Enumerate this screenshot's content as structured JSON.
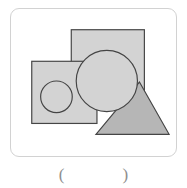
{
  "figure": {
    "frame": {
      "x": 10,
      "y": 8,
      "width": 167,
      "height": 149,
      "corner_radius": 9,
      "border_color": "#d2d2d2",
      "background_color": "#ffffff"
    },
    "palette": {
      "shape_fill_light": "#d3d3d3",
      "shape_fill_medium": "#b6b6b6",
      "shape_stroke": "#454545",
      "frame_border": "#d2d2d2",
      "paren_text": "#8e8e8e"
    },
    "shapes": [
      {
        "name": "large-square",
        "type": "rect",
        "x": 61,
        "y": 21,
        "width": 74,
        "height": 74,
        "fill": "#d3d3d3",
        "stroke": "#454545",
        "stroke_width": 1.2,
        "z": 1
      },
      {
        "name": "small-square",
        "type": "rect",
        "x": 21,
        "y": 53,
        "width": 66,
        "height": 63,
        "fill": "#d3d3d3",
        "stroke": "#454545",
        "stroke_width": 1.2,
        "z": 2
      },
      {
        "name": "triangle",
        "type": "polygon",
        "points": "130,74 160,127 86,127",
        "fill": "#b6b6b6",
        "stroke": "#454545",
        "stroke_width": 1.2,
        "z": 3
      },
      {
        "name": "inner-circle",
        "type": "circle",
        "cx": 46,
        "cy": 89,
        "r": 16,
        "fill": "#d3d3d3",
        "stroke": "#454545",
        "stroke_width": 1.2,
        "z": 4
      },
      {
        "name": "large-circle",
        "type": "circle",
        "cx": 97,
        "cy": 73,
        "r": 31,
        "fill": "#d3d3d3",
        "stroke": "#454545",
        "stroke_width": 1.2,
        "z": 5
      }
    ],
    "shape_count": 5
  },
  "answer": {
    "open_paren": "(",
    "close_paren": ")",
    "value": ""
  }
}
